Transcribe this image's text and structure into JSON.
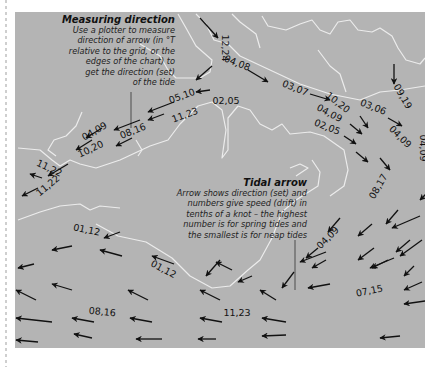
{
  "notes": {
    "measuring": {
      "title": "Measuring direction",
      "lines": [
        "Use a plotter to measure",
        "direction of arrow (in °T",
        "relative to the grid, or the",
        "edges of the chart) to",
        "get the direction (set)",
        "of the tide"
      ]
    },
    "tidal": {
      "title": "Tidal arrow",
      "lines": [
        "Arrow shows direction (set) and",
        "numbers give speed (drift) in",
        "tenths of a knot – the highest",
        "number is for spring tides and",
        "the smallest is for neap tides"
      ]
    }
  },
  "colors": {
    "sea": "#b4b4b4",
    "coast": "#ececec",
    "arrow": "#111111",
    "page": "#ffffff"
  },
  "labels": [
    {
      "text": "12,24",
      "x": 222,
      "y": 48,
      "rot": 90
    },
    {
      "text": "04,08",
      "x": 236,
      "y": 66,
      "rot": 22
    },
    {
      "text": "03,07",
      "x": 294,
      "y": 91,
      "rot": 22
    },
    {
      "text": "10,20",
      "x": 336,
      "y": 105,
      "rot": 38
    },
    {
      "text": "04,09",
      "x": 328,
      "y": 116,
      "rot": 28
    },
    {
      "text": "02,05",
      "x": 326,
      "y": 130,
      "rot": 22
    },
    {
      "text": "03,06",
      "x": 372,
      "y": 110,
      "rot": 22
    },
    {
      "text": "09,19",
      "x": 400,
      "y": 98,
      "rot": 60
    },
    {
      "text": "04,09",
      "x": 398,
      "y": 139,
      "rot": 45
    },
    {
      "text": "04,09",
      "x": 420,
      "y": 148,
      "rot": 90
    },
    {
      "text": "05,10",
      "x": 183,
      "y": 99,
      "rot": -20
    },
    {
      "text": "02,05",
      "x": 226,
      "y": 104,
      "rot": 0
    },
    {
      "text": "11,23",
      "x": 186,
      "y": 118,
      "rot": -20
    },
    {
      "text": "04,09",
      "x": 96,
      "y": 134,
      "rot": -30
    },
    {
      "text": "08,16",
      "x": 134,
      "y": 134,
      "rot": -22
    },
    {
      "text": "10,20",
      "x": 92,
      "y": 152,
      "rot": -25
    },
    {
      "text": "11,22",
      "x": 48,
      "y": 171,
      "rot": 25
    },
    {
      "text": "11,22",
      "x": 50,
      "y": 188,
      "rot": -40
    },
    {
      "text": "01,12",
      "x": 86,
      "y": 233,
      "rot": 12
    },
    {
      "text": "01,12",
      "x": 162,
      "y": 272,
      "rot": 28
    },
    {
      "text": "08,16",
      "x": 102,
      "y": 315,
      "rot": 5
    },
    {
      "text": "11,23",
      "x": 237,
      "y": 316,
      "rot": 0
    },
    {
      "text": "04,09",
      "x": 330,
      "y": 240,
      "rot": -45
    },
    {
      "text": "08,17",
      "x": 381,
      "y": 188,
      "rot": -60
    },
    {
      "text": "07,15",
      "x": 370,
      "y": 294,
      "rot": -12
    }
  ],
  "arrows": [
    [
      200,
      18,
      218,
      38
    ],
    [
      248,
      70,
      268,
      82
    ],
    [
      310,
      94,
      330,
      100
    ],
    [
      360,
      116,
      368,
      128
    ],
    [
      388,
      118,
      402,
      126
    ],
    [
      428,
      116,
      442,
      126
    ],
    [
      394,
      64,
      394,
      84
    ],
    [
      434,
      142,
      434,
      160
    ],
    [
      350,
      124,
      362,
      134
    ],
    [
      344,
      136,
      356,
      144
    ],
    [
      356,
      152,
      368,
      162
    ],
    [
      380,
      158,
      390,
      170
    ],
    [
      212,
      66,
      196,
      80
    ],
    [
      210,
      90,
      196,
      92
    ],
    [
      174,
      102,
      148,
      112
    ],
    [
      164,
      114,
      148,
      120
    ],
    [
      140,
      120,
      114,
      130
    ],
    [
      132,
      138,
      116,
      146
    ],
    [
      102,
      128,
      86,
      138
    ],
    [
      92,
      140,
      76,
      150
    ],
    [
      68,
      164,
      48,
      176
    ],
    [
      42,
      178,
      30,
      174
    ],
    [
      38,
      188,
      22,
      196
    ],
    [
      120,
      232,
      104,
      238
    ],
    [
      72,
      246,
      52,
      250
    ],
    [
      122,
      256,
      100,
      250
    ],
    [
      174,
      264,
      152,
      256
    ],
    [
      232,
      270,
      216,
      262
    ],
    [
      34,
      264,
      18,
      268
    ],
    [
      72,
      290,
      52,
      284
    ],
    [
      148,
      300,
      128,
      290
    ],
    [
      220,
      300,
      200,
      290
    ],
    [
      276,
      300,
      260,
      290
    ],
    [
      36,
      300,
      16,
      290
    ],
    [
      52,
      322,
      16,
      318
    ],
    [
      94,
      322,
      72,
      318
    ],
    [
      152,
      322,
      130,
      318
    ],
    [
      222,
      322,
      200,
      318
    ],
    [
      286,
      322,
      262,
      318
    ],
    [
      38,
      342,
      16,
      340
    ],
    [
      92,
      338,
      74,
      334
    ],
    [
      162,
      339,
      136,
      339
    ],
    [
      216,
      339,
      198,
      339
    ],
    [
      286,
      335,
      262,
      336
    ],
    [
      400,
      336,
      380,
      338
    ],
    [
      326,
      252,
      300,
      262
    ],
    [
      330,
      284,
      308,
      288
    ],
    [
      394,
      258,
      370,
      268
    ],
    [
      422,
      240,
      400,
      256
    ],
    [
      420,
      216,
      392,
      228
    ],
    [
      432,
      300,
      404,
      304
    ],
    [
      422,
      282,
      404,
      290
    ],
    [
      374,
      248,
      358,
      260
    ],
    [
      410,
      240,
      396,
      252
    ],
    [
      326,
      260,
      312,
      268
    ],
    [
      340,
      218,
      328,
      232
    ],
    [
      372,
      224,
      358,
      236
    ],
    [
      398,
      210,
      386,
      224
    ],
    [
      430,
      190,
      420,
      200
    ],
    [
      388,
      260,
      372,
      268
    ],
    [
      414,
      266,
      404,
      276
    ],
    [
      220,
      260,
      206,
      276
    ],
    [
      294,
      272,
      282,
      288
    ],
    [
      318,
      248,
      306,
      258
    ],
    [
      252,
      276,
      238,
      282
    ]
  ]
}
